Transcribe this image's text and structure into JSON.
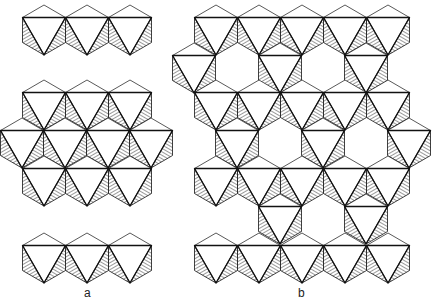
{
  "figure": {
    "unit": {
      "half_width": 21.5,
      "top_line_offset": 12.5,
      "side_bottom_offset": 37.5,
      "height": 50
    },
    "colors": {
      "stroke": "#111111",
      "hatch": "#333333",
      "background": "#ffffff"
    },
    "panels": [
      {
        "label": "a",
        "label_pos": [
          84,
          286
        ],
        "rows": [
          {
            "y0": 5,
            "centers": [
              44,
              87,
              130
            ]
          },
          {
            "y0": 80,
            "centers": [
              44,
              87,
              130
            ]
          },
          {
            "y0": 118,
            "centers": [
              22,
              65,
              108,
              151
            ]
          },
          {
            "y0": 156,
            "centers": [
              44,
              87,
              130
            ]
          },
          {
            "y0": 233,
            "centers": [
              44,
              87,
              130
            ]
          }
        ]
      },
      {
        "label": "b",
        "label_pos": [
          298,
          286
        ],
        "rows": [
          {
            "y0": 5,
            "centers": [
              216,
              259,
              302,
              345,
              388
            ]
          },
          {
            "y0": 43,
            "centers": [
              194,
              280,
              366
            ]
          },
          {
            "y0": 80,
            "centers": [
              216,
              259,
              302,
              345,
              388
            ]
          },
          {
            "y0": 118,
            "centers": [
              237,
              323,
              409
            ]
          },
          {
            "y0": 156,
            "centers": [
              216,
              259,
              302,
              345,
              388
            ]
          },
          {
            "y0": 194,
            "centers": [
              280,
              366
            ]
          },
          {
            "y0": 233,
            "centers": [
              216,
              259,
              302,
              345,
              388
            ]
          }
        ]
      }
    ]
  }
}
